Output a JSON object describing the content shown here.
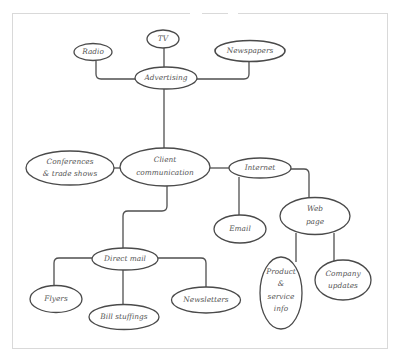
{
  "diagram": {
    "type": "mind-map",
    "colors": {
      "stroke": "#4a4a4a",
      "text": "#555555",
      "frame": "#d9d9d9",
      "background": "#ffffff"
    },
    "nodes": {
      "advertising": {
        "label": "Advertising"
      },
      "radio": {
        "label": "Radio"
      },
      "tv": {
        "label": "TV"
      },
      "newspapers": {
        "label": "Newspapers"
      },
      "client": {
        "line1": "Client",
        "line2": "communication"
      },
      "conferences": {
        "line1": "Conferences",
        "line2": "& trade shows"
      },
      "internet": {
        "label": "Internet"
      },
      "email": {
        "label": "Email"
      },
      "webpage": {
        "line1": "Web",
        "line2": "page"
      },
      "product": {
        "line1": "Product",
        "line2": "&",
        "line3": "service",
        "line4": "info"
      },
      "company": {
        "line1": "Company",
        "line2": "updates"
      },
      "directmail": {
        "label": "Direct mail"
      },
      "flyers": {
        "label": "Flyers"
      },
      "bill": {
        "label": "Bill stuffings"
      },
      "newsletters": {
        "label": "Newsletters"
      }
    },
    "edges": [
      [
        "advertising",
        "radio"
      ],
      [
        "advertising",
        "tv"
      ],
      [
        "advertising",
        "newspapers"
      ],
      [
        "client",
        "advertising"
      ],
      [
        "client",
        "conferences"
      ],
      [
        "client",
        "internet"
      ],
      [
        "client",
        "directmail"
      ],
      [
        "internet",
        "email"
      ],
      [
        "internet",
        "webpage"
      ],
      [
        "webpage",
        "product"
      ],
      [
        "webpage",
        "company"
      ],
      [
        "directmail",
        "flyers"
      ],
      [
        "directmail",
        "bill"
      ],
      [
        "directmail",
        "newsletters"
      ]
    ]
  }
}
